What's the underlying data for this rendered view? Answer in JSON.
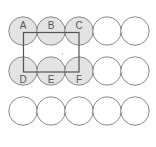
{
  "diagram": {
    "grid": {
      "rows": 3,
      "cols": 5,
      "circle_radius": 14.2,
      "col_x": [
        23,
        51,
        79,
        107,
        135
      ],
      "row_y": [
        31,
        71,
        111
      ]
    },
    "colors": {
      "shaded_fill": "#e3e3e3",
      "stroke": "#8a8a8a",
      "rect_stroke": "#555555",
      "label": "#555555"
    },
    "labels": {
      "A": "A",
      "B": "B",
      "C": "C",
      "D": "D",
      "E": "E",
      "F": "F"
    },
    "shaded_circles": [
      "A",
      "B",
      "C",
      "D",
      "E",
      "F"
    ],
    "rectangle": {
      "x1": 23,
      "y1": 32,
      "x2": 79,
      "y2": 72
    }
  }
}
